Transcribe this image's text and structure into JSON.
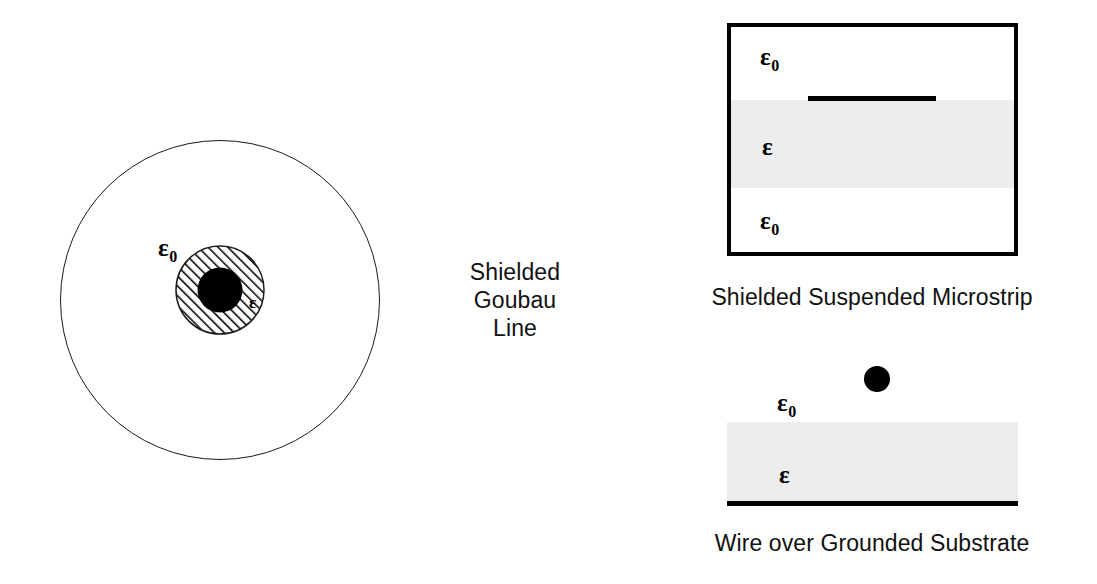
{
  "figure": {
    "background_color": "#ffffff",
    "ink_color": "#000000",
    "dielectric_fill_color": "#ededed",
    "width": 1097,
    "height": 584
  },
  "symbols": {
    "epsilon": "ε",
    "epsilon_zero_base": "ε",
    "epsilon_zero_subscript": "0"
  },
  "panels": [
    {
      "id": "shielded-goubau-line",
      "caption": "Shielded\nGoubau\nLine",
      "caption_lines": [
        "Shielded",
        "Goubau",
        "Line"
      ],
      "geometry": {
        "outer_shield_center_x": 220,
        "outer_shield_center_y": 300,
        "outer_shield_radius": 160,
        "dielectric_center_x": 220,
        "dielectric_center_y": 290,
        "dielectric_radius": 44,
        "core_radius": 22,
        "hatch_angle_deg": 45
      },
      "labels": [
        {
          "name": "outer-region-permittivity",
          "base": "ε",
          "sub": "0",
          "x": 158,
          "y": 235
        },
        {
          "name": "dielectric-permittivity",
          "base": "ε",
          "sub": "",
          "x": 249,
          "y": 294
        }
      ]
    },
    {
      "id": "shielded-suspended-microstrip",
      "caption": "Shielded Suspended Microstrip",
      "caption_lines": [
        "Shielded Suspended Microstrip"
      ],
      "geometry": {
        "box_left": 727,
        "box_top": 23,
        "box_width": 291,
        "box_height": 233,
        "box_border_width": 4,
        "slab_top": 100,
        "slab_height": 88,
        "strip_left": 808,
        "strip_top": 96,
        "strip_width": 128,
        "strip_height": 5
      },
      "labels": [
        {
          "name": "upper-air-permittivity",
          "base": "ε",
          "sub": "0",
          "x": 760,
          "y": 44
        },
        {
          "name": "slab-permittivity",
          "base": "ε",
          "sub": "",
          "x": 762,
          "y": 134
        },
        {
          "name": "lower-air-permittivity",
          "base": "ε",
          "sub": "0",
          "x": 760,
          "y": 208
        }
      ]
    },
    {
      "id": "wire-over-grounded-substrate",
      "caption": "Wire over Grounded Substrate",
      "caption_lines": [
        "Wire over Grounded Substrate"
      ],
      "geometry": {
        "wire_center_x": 877,
        "wire_center_y": 379,
        "wire_radius": 13,
        "substrate_left": 727,
        "substrate_top": 422,
        "substrate_width": 291,
        "substrate_height": 81,
        "ground_plane_top": 501,
        "ground_plane_height": 5
      },
      "labels": [
        {
          "name": "air-permittivity",
          "base": "ε",
          "sub": "0",
          "x": 777,
          "y": 390
        },
        {
          "name": "substrate-permittivity",
          "base": "ε",
          "sub": "",
          "x": 779,
          "y": 462
        }
      ]
    }
  ]
}
